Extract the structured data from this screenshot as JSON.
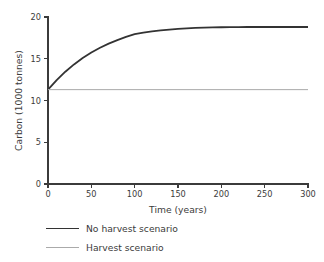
{
  "chart_data": {
    "type": "line",
    "title": "",
    "xlabel": "Time (years)",
    "ylabel": "Carbon (1000 tonnes)",
    "xlim": [
      0,
      300
    ],
    "ylim": [
      0,
      20
    ],
    "xticks": [
      0,
      50,
      100,
      150,
      200,
      250,
      300
    ],
    "xtick_labels": [
      "0",
      "50",
      "100",
      "150",
      "200",
      "250",
      "300"
    ],
    "yticks": [
      0,
      5,
      10,
      15,
      20
    ],
    "ytick_labels": [
      "0",
      "5",
      "10",
      "15",
      "20"
    ],
    "grid": false,
    "legend_position": "below-axes-left",
    "series": [
      {
        "name": "No harvest scenario",
        "color": "#333333",
        "width": 1.8,
        "x": [
          0,
          10,
          20,
          30,
          40,
          50,
          60,
          70,
          80,
          90,
          100,
          110,
          120,
          130,
          140,
          150,
          160,
          170,
          180,
          190,
          200,
          210,
          220,
          230,
          240,
          250,
          260,
          270,
          280,
          290,
          300
        ],
        "values": [
          11.3,
          12.45,
          13.45,
          14.32,
          15.08,
          15.74,
          16.31,
          16.81,
          17.24,
          17.62,
          17.95,
          18.13,
          18.28,
          18.4,
          18.5,
          18.58,
          18.64,
          18.69,
          18.72,
          18.75,
          18.77,
          18.78,
          18.79,
          18.8,
          18.8,
          18.8,
          18.8,
          18.8,
          18.8,
          18.8,
          18.8
        ]
      },
      {
        "name": "Harvest scenario",
        "color": "#aaaaaa",
        "width": 1.0,
        "x": [
          0,
          300
        ],
        "values": [
          11.3,
          11.3
        ]
      }
    ]
  },
  "legend": {
    "items": [
      {
        "label": "No harvest scenario",
        "color": "#333333",
        "width": 1.9
      },
      {
        "label": "Harvest scenario",
        "color": "#aaaaaa",
        "width": 1.0
      }
    ]
  },
  "axes": {
    "line_color": "#3b3b3b"
  }
}
